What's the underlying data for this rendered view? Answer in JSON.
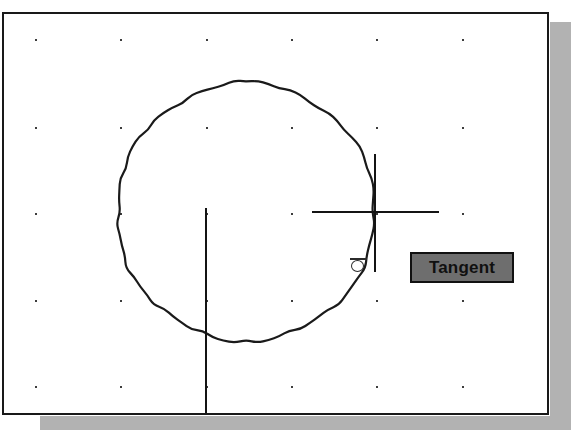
{
  "application": {
    "kind": "cad-drawing-canvas",
    "canvas_background": "#ffffff",
    "border_color": "#191919",
    "shadow_color": "#b2b2b2"
  },
  "canvas": {
    "grid": {
      "visible": true,
      "dot_color": "#3c3c3c",
      "x_positions": [
        31,
        116,
        202,
        287,
        372,
        458,
        543
      ],
      "y_positions": [
        25,
        113,
        199,
        286,
        372
      ]
    },
    "entities": [
      {
        "name": "circle",
        "type": "circle",
        "center_x": 242,
        "center_y": 198,
        "radius": 129,
        "stroke": "#1a1a1a",
        "stroke_width": 2
      },
      {
        "name": "vertical-construction-line",
        "type": "line",
        "x1": 201,
        "y1": 194,
        "x2": 201,
        "y2": 401,
        "stroke": "#141414",
        "stroke_width": 2
      }
    ]
  },
  "cursor": {
    "name": "crosshair",
    "center_x": 370,
    "center_y": 197,
    "horizontal_extent": [
      308,
      435
    ],
    "vertical_extent": [
      140,
      258
    ],
    "color": "#141414"
  },
  "osnap": {
    "type": "tangent",
    "marker_glyph": "circle-with-bar",
    "marker_x": 356,
    "marker_y": 250,
    "marker_color": "#2b2b2b"
  },
  "tooltip": {
    "label": "Tangent",
    "background": "#6e6e6e",
    "border": "#111111",
    "text_color": "#101010",
    "x": 406,
    "y": 238,
    "width": 104,
    "height": 31
  }
}
